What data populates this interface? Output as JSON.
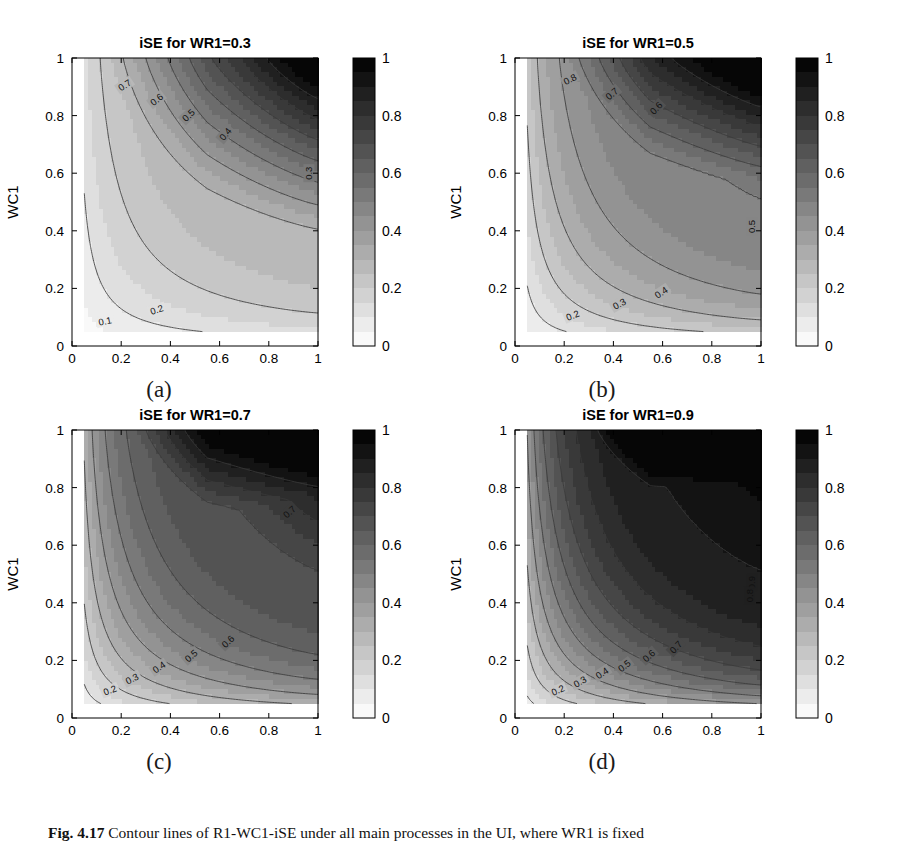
{
  "figure": {
    "caption_prefix": "Fig. 4.17",
    "caption_text": "Contour lines of R1-WC1-iSE under all main processes in the UI, where WR1 is fixed",
    "background": "#ffffff"
  },
  "common": {
    "xlabel": "R1",
    "ylabel": "WC1",
    "xticks": [
      "0",
      "0.2",
      "0.4",
      "0.6",
      "0.8",
      "1"
    ],
    "xtick_values": [
      0,
      0.2,
      0.4,
      0.6,
      0.8,
      1
    ],
    "yticks": [
      "0",
      "0.2",
      "0.4",
      "0.6",
      "0.8",
      "1"
    ],
    "ytick_values": [
      0,
      0.2,
      0.4,
      0.6,
      0.8,
      1
    ],
    "colorbar_ticks": [
      "0",
      "0.2",
      "0.4",
      "0.6",
      "0.8",
      "1"
    ],
    "colorbar_tick_values": [
      0,
      0.2,
      0.4,
      0.6,
      0.8,
      1
    ],
    "colormap": "gray-reversed",
    "color_low": "#ffffff",
    "color_high": "#000000",
    "contour_line_color": "#3a3a3a",
    "axis_color": "#000000",
    "data_xrange": [
      0.05,
      1.0
    ],
    "data_yrange": [
      0.05,
      1.0
    ]
  },
  "panels": [
    {
      "id": "a",
      "label": "(a)",
      "title": "iSE for WR1=0.3",
      "wr1": 0.3,
      "plateau_level": 0.3,
      "plateau_y": 0.3,
      "contour_labels": [
        {
          "text": "0.7",
          "x": 0.215,
          "y": 0.905,
          "rot": -34
        },
        {
          "text": "0.6",
          "x": 0.345,
          "y": 0.855,
          "rot": -38
        },
        {
          "text": "0.5",
          "x": 0.475,
          "y": 0.8,
          "rot": -44
        },
        {
          "text": "0.4",
          "x": 0.625,
          "y": 0.735,
          "rot": -50
        },
        {
          "text": "0.3",
          "x": 0.965,
          "y": 0.6,
          "rot": -90
        },
        {
          "text": "0.2",
          "x": 0.345,
          "y": 0.125,
          "rot": -18
        },
        {
          "text": "0.1",
          "x": 0.135,
          "y": 0.085,
          "rot": -12
        }
      ]
    },
    {
      "id": "b",
      "label": "(b)",
      "title": "iSE for WR1=0.5",
      "wr1": 0.5,
      "plateau_level": 0.5,
      "plateau_y": 0.5,
      "contour_labels": [
        {
          "text": "0.8",
          "x": 0.225,
          "y": 0.925,
          "rot": -28
        },
        {
          "text": "0.7",
          "x": 0.395,
          "y": 0.875,
          "rot": -40
        },
        {
          "text": "0.6",
          "x": 0.575,
          "y": 0.825,
          "rot": -46
        },
        {
          "text": "0.5",
          "x": 0.965,
          "y": 0.415,
          "rot": -90
        },
        {
          "text": "0.4",
          "x": 0.595,
          "y": 0.185,
          "rot": -34
        },
        {
          "text": "0.3",
          "x": 0.425,
          "y": 0.145,
          "rot": -30
        },
        {
          "text": "0.2",
          "x": 0.235,
          "y": 0.105,
          "rot": -22
        }
      ]
    },
    {
      "id": "c",
      "label": "(c)",
      "title": "iSE for WR1=0.7",
      "wr1": 0.7,
      "plateau_level": 0.7,
      "plateau_y": 0.7,
      "contour_labels": [
        {
          "text": "0.7",
          "x": 0.885,
          "y": 0.715,
          "rot": -42
        },
        {
          "text": "0.6",
          "x": 0.635,
          "y": 0.265,
          "rot": -44
        },
        {
          "text": "0.5",
          "x": 0.485,
          "y": 0.215,
          "rot": -40
        },
        {
          "text": "0.4",
          "x": 0.355,
          "y": 0.175,
          "rot": -34
        },
        {
          "text": "0.3",
          "x": 0.245,
          "y": 0.135,
          "rot": -28
        },
        {
          "text": "0.2",
          "x": 0.155,
          "y": 0.095,
          "rot": -22
        }
      ]
    },
    {
      "id": "d",
      "label": "(d)",
      "title": "iSE for WR1=0.9",
      "wr1": 0.9,
      "plateau_level": 0.9,
      "plateau_y": 0.9,
      "contour_labels": [
        {
          "text": "0.9",
          "x": 0.965,
          "y": 0.47,
          "rot": -90
        },
        {
          "text": "0.8",
          "x": 0.955,
          "y": 0.425,
          "rot": -90
        },
        {
          "text": "0.7",
          "x": 0.655,
          "y": 0.245,
          "rot": -46
        },
        {
          "text": "0.6",
          "x": 0.545,
          "y": 0.215,
          "rot": -42
        },
        {
          "text": "0.5",
          "x": 0.445,
          "y": 0.18,
          "rot": -38
        },
        {
          "text": "0.4",
          "x": 0.355,
          "y": 0.155,
          "rot": -34
        },
        {
          "text": "0.3",
          "x": 0.265,
          "y": 0.125,
          "rot": -30
        },
        {
          "text": "0.2",
          "x": 0.175,
          "y": 0.095,
          "rot": -24
        }
      ]
    }
  ],
  "chart_data": {
    "type": "heatmap",
    "subtype": "filled-contour",
    "n_panels": 4,
    "title": "Contour lines of R1-WC1-iSE under all main processes in the UI",
    "xlabel": "R1",
    "ylabel": "WC1",
    "zlabel": "iSE",
    "xlim": [
      0,
      1
    ],
    "ylim": [
      0,
      1
    ],
    "zlim": [
      0,
      1
    ],
    "grid": false,
    "legend": "colorbar-right",
    "contour_levels": [
      0.1,
      0.2,
      0.3,
      0.4,
      0.5,
      0.6,
      0.7,
      0.8,
      0.9
    ],
    "model": "iSE(R1,WC1;WR1) = max( min(WR1, 1-WC1*(1-R1)) , WC1*R1 ) approximation; saturates at WR1 for large R1",
    "panels": [
      {
        "panel": "(a)",
        "title": "iSE for WR1=0.3",
        "parameter": {
          "name": "WR1",
          "value": 0.3
        },
        "x": [
          0.05,
          0.2,
          0.4,
          0.6,
          0.8,
          1.0
        ],
        "y": [
          0.05,
          0.2,
          0.4,
          0.6,
          0.8,
          1.0
        ],
        "z": [
          [
            0.05,
            0.09,
            0.14,
            0.19,
            0.24,
            0.3
          ],
          [
            0.1,
            0.16,
            0.22,
            0.27,
            0.3,
            0.3
          ],
          [
            0.16,
            0.26,
            0.34,
            0.3,
            0.3,
            0.3
          ],
          [
            0.23,
            0.38,
            0.52,
            0.46,
            0.36,
            0.3
          ],
          [
            0.32,
            0.55,
            0.7,
            0.62,
            0.48,
            0.36
          ],
          [
            0.45,
            0.72,
            0.86,
            0.78,
            0.62,
            0.45
          ]
        ],
        "plateau": {
          "value": 0.3,
          "region": "right of R1~0.5 and above WC1~0.3"
        }
      },
      {
        "panel": "(b)",
        "title": "iSE for WR1=0.5",
        "parameter": {
          "name": "WR1",
          "value": 0.5
        },
        "x": [
          0.05,
          0.2,
          0.4,
          0.6,
          0.8,
          1.0
        ],
        "y": [
          0.05,
          0.2,
          0.4,
          0.6,
          0.8,
          1.0
        ],
        "z": [
          [
            0.06,
            0.12,
            0.2,
            0.28,
            0.36,
            0.45
          ],
          [
            0.12,
            0.22,
            0.34,
            0.44,
            0.5,
            0.5
          ],
          [
            0.2,
            0.36,
            0.5,
            0.5,
            0.5,
            0.5
          ],
          [
            0.29,
            0.5,
            0.66,
            0.62,
            0.55,
            0.5
          ],
          [
            0.4,
            0.66,
            0.82,
            0.76,
            0.66,
            0.55
          ],
          [
            0.55,
            0.82,
            0.93,
            0.88,
            0.76,
            0.62
          ]
        ],
        "plateau": {
          "value": 0.5,
          "region": "right of R1~0.45 and above WC1~0.5"
        }
      },
      {
        "panel": "(c)",
        "title": "iSE for WR1=0.7",
        "parameter": {
          "name": "WR1",
          "value": 0.7
        },
        "x": [
          0.05,
          0.2,
          0.4,
          0.6,
          0.8,
          1.0
        ],
        "y": [
          0.05,
          0.2,
          0.4,
          0.6,
          0.8,
          1.0
        ],
        "z": [
          [
            0.07,
            0.16,
            0.28,
            0.4,
            0.52,
            0.62
          ],
          [
            0.15,
            0.3,
            0.46,
            0.6,
            0.7,
            0.7
          ],
          [
            0.25,
            0.46,
            0.65,
            0.7,
            0.7,
            0.7
          ],
          [
            0.36,
            0.62,
            0.8,
            0.78,
            0.72,
            0.7
          ],
          [
            0.5,
            0.78,
            0.9,
            0.88,
            0.8,
            0.72
          ],
          [
            0.66,
            0.9,
            0.97,
            0.94,
            0.87,
            0.78
          ]
        ],
        "plateau": {
          "value": 0.7,
          "region": "right of R1~0.45 and above WC1~0.7"
        }
      },
      {
        "panel": "(d)",
        "title": "iSE for WR1=0.9",
        "parameter": {
          "name": "WR1",
          "value": 0.9
        },
        "x": [
          0.05,
          0.2,
          0.4,
          0.6,
          0.8,
          1.0
        ],
        "y": [
          0.05,
          0.2,
          0.4,
          0.6,
          0.8,
          1.0
        ],
        "z": [
          [
            0.08,
            0.2,
            0.36,
            0.52,
            0.68,
            0.82
          ],
          [
            0.18,
            0.38,
            0.58,
            0.75,
            0.88,
            0.9
          ],
          [
            0.3,
            0.56,
            0.78,
            0.9,
            0.9,
            0.9
          ],
          [
            0.44,
            0.74,
            0.9,
            0.92,
            0.9,
            0.9
          ],
          [
            0.6,
            0.88,
            0.96,
            0.96,
            0.93,
            0.9
          ],
          [
            0.78,
            0.96,
            0.99,
            0.98,
            0.95,
            0.91
          ]
        ],
        "plateau": {
          "value": 0.9,
          "region": "right of R1~0.5 and above WC1~0.9"
        }
      }
    ]
  }
}
